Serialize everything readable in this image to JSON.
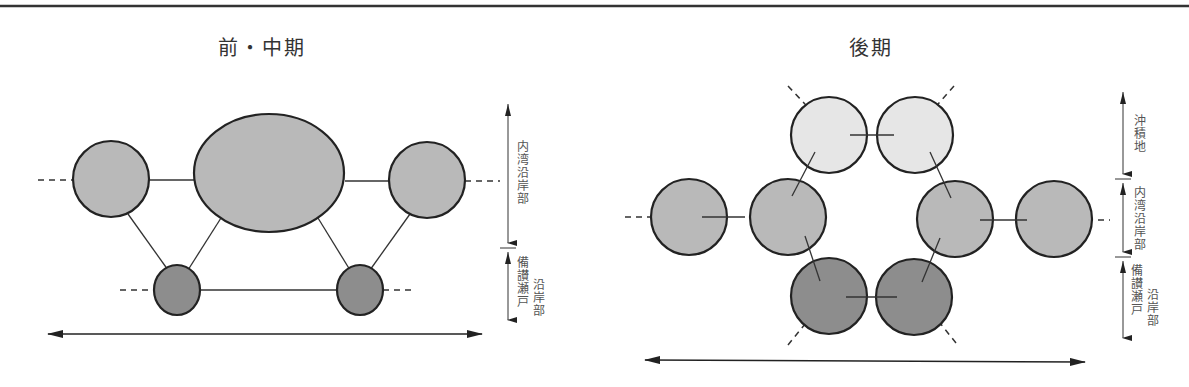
{
  "colors": {
    "stroke": "#222222",
    "fill_light": "#e6e6e6",
    "fill_mid": "#b9b9b9",
    "fill_dark": "#8d8d8d",
    "text": "#444444"
  },
  "panels": [
    {
      "id": "early-middle",
      "title": "前・中期",
      "scale_labels": [
        {
          "text": "内湾沿岸部"
        },
        {
          "text": "備讃瀬戸",
          "sub": "沿岸部"
        }
      ]
    },
    {
      "id": "late",
      "title": "後期",
      "scale_labels": [
        {
          "text": "沖積地"
        },
        {
          "text": "内湾沿岸部"
        },
        {
          "text": "備讃瀬戸",
          "sub": "沿岸部"
        }
      ]
    }
  ]
}
